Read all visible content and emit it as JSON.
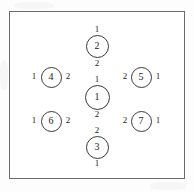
{
  "figure": {
    "title": "",
    "frame": {
      "border_color": "#6b6b6b",
      "background": "#ffffff"
    },
    "node_border_color": "#3a3a3a",
    "text_color": "#1b1b1b"
  },
  "nodes": [
    {
      "id": "node-top",
      "label": "2",
      "x": 97,
      "y": 46,
      "d": 23,
      "ports": [
        {
          "name": "port-top",
          "label": "1",
          "x": 97,
          "y": 30
        },
        {
          "name": "port-bottom",
          "label": "2",
          "x": 97,
          "y": 64
        }
      ]
    },
    {
      "id": "node-center",
      "label": "1",
      "x": 97,
      "y": 97,
      "d": 25,
      "ports": [
        {
          "name": "port-top",
          "label": "1",
          "x": 97,
          "y": 80
        },
        {
          "name": "port-bottom",
          "label": "2",
          "x": 97,
          "y": 115
        }
      ]
    },
    {
      "id": "node-bottom",
      "label": "3",
      "x": 97,
      "y": 147,
      "d": 23,
      "ports": [
        {
          "name": "port-top",
          "label": "2",
          "x": 97,
          "y": 131
        },
        {
          "name": "port-bottom",
          "label": "1",
          "x": 97,
          "y": 164
        }
      ]
    },
    {
      "id": "node-left-upper",
      "label": "4",
      "x": 51,
      "y": 77,
      "d": 21,
      "ports": [
        {
          "name": "port-left",
          "label": "1",
          "x": 34,
          "y": 77
        },
        {
          "name": "port-right",
          "label": "2",
          "x": 68,
          "y": 77
        }
      ]
    },
    {
      "id": "node-left-lower",
      "label": "6",
      "x": 51,
      "y": 121,
      "d": 21,
      "ports": [
        {
          "name": "port-left",
          "label": "1",
          "x": 34,
          "y": 121
        },
        {
          "name": "port-right",
          "label": "2",
          "x": 68,
          "y": 121
        }
      ]
    },
    {
      "id": "node-right-upper",
      "label": "5",
      "x": 141,
      "y": 77,
      "d": 21,
      "ports": [
        {
          "name": "port-left",
          "label": "2",
          "x": 125,
          "y": 77
        },
        {
          "name": "port-right",
          "label": "1",
          "x": 158,
          "y": 77
        }
      ]
    },
    {
      "id": "node-right-lower",
      "label": "7",
      "x": 141,
      "y": 121,
      "d": 21,
      "ports": [
        {
          "name": "port-left",
          "label": "2",
          "x": 125,
          "y": 121
        },
        {
          "name": "port-right",
          "label": "1",
          "x": 158,
          "y": 121
        }
      ]
    }
  ]
}
